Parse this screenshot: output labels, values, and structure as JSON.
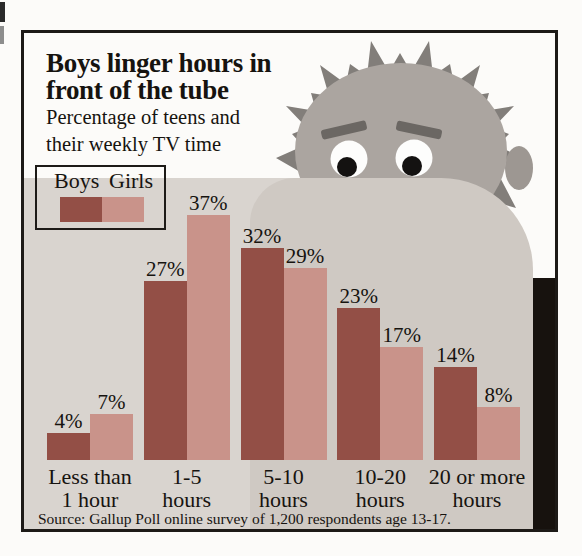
{
  "header": {
    "title_line1": "Boys linger hours in",
    "title_line2": "front of the tube",
    "subtitle_line1": "Percentage of teens and",
    "subtitle_line2": "their weekly TV time"
  },
  "legend": {
    "items": [
      {
        "label": "Boys",
        "color": "#934f46"
      },
      {
        "label": "Girls",
        "color": "#c9938a"
      }
    ]
  },
  "chart_data": {
    "type": "bar",
    "title": "Boys linger hours in front of the tube",
    "subtitle": "Percentage of teens and their weekly TV time",
    "categories": [
      "Less than 1 hour",
      "1-5 hours",
      "5-10 hours",
      "10-20 hours",
      "20 or more hours"
    ],
    "category_label_lines": [
      [
        "Less than",
        "1 hour"
      ],
      [
        "1-5",
        "hours"
      ],
      [
        "5-10",
        "hours"
      ],
      [
        "10-20",
        "hours"
      ],
      [
        "20 or more",
        "hours"
      ]
    ],
    "series": [
      {
        "name": "Boys",
        "color": "#934f46",
        "values": [
          4,
          27,
          32,
          23,
          14
        ]
      },
      {
        "name": "Girls",
        "color": "#c9938a",
        "values": [
          7,
          37,
          29,
          17,
          8
        ]
      }
    ],
    "value_suffix": "%",
    "value_labels": true,
    "ylim": [
      0,
      40
    ],
    "grid": false,
    "legend_position": "top-left"
  },
  "source": {
    "text": "Source: Gallup Poll online survey of 1,200 respondents age 13-17."
  }
}
